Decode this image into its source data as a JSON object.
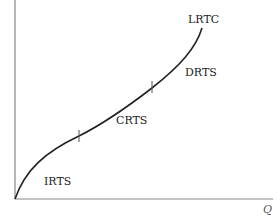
{
  "diagram": {
    "curve_label": "LRTC",
    "x_axis_label": "Q",
    "regions": [
      {
        "label": "IRTS"
      },
      {
        "label": "CRTS"
      },
      {
        "label": "DRTS"
      }
    ],
    "colors": {
      "axis": "#888888",
      "curve": "#222222",
      "text": "#222222"
    }
  }
}
